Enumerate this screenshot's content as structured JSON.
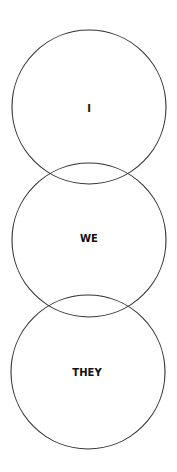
{
  "diagram": {
    "type": "overlapping-circles",
    "stroke_color": "#333333",
    "circles": [
      {
        "label": "I",
        "cx": 89,
        "cy": 107,
        "r": 77
      },
      {
        "label": "WE",
        "cx": 89,
        "cy": 240,
        "r": 77
      },
      {
        "label": "THEY",
        "cx": 88,
        "cy": 372,
        "r": 77
      }
    ]
  }
}
